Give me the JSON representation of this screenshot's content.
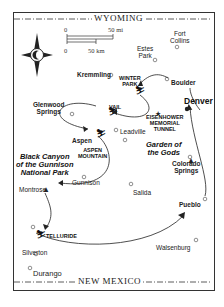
{
  "map": {
    "borders": {
      "north": "WYOMING",
      "south": "NEW MEXICO"
    },
    "scale": {
      "miles_start": "0",
      "miles_end": "50 mi",
      "km_start": "0",
      "km_end": "50 km"
    },
    "compass_icon": "compass-rose-icon",
    "towns": {
      "fort_collins": "Fort\nCollins",
      "estes_park": "Estes\nPark",
      "kremmling": "Kremmling",
      "boulder": "Boulder",
      "denver": "Denver",
      "glenwood_springs": "Glenwood\nSprings",
      "leadville": "Leadville",
      "aspen": "Aspen",
      "gunnison": "Gunnison",
      "montrose": "Montrose",
      "colorado_springs": "Colorado\nSprings",
      "salida": "Salida",
      "pueblo": "Pueblo",
      "silverton": "Silverton",
      "walsenburg": "Walsenburg",
      "durango": "Durango"
    },
    "ski_areas": {
      "winter_park": "WINTER\nPARK",
      "vail": "VAIL",
      "aspen_mountain": "ASPEN\nMOUNTAIN",
      "telluride": "TELLURIDE"
    },
    "landmarks": {
      "eisenhower_tunnel": "EISENHOWER\nMEMORIAL\nTUNNEL",
      "black_canyon": "Black Canyon\nof the Gunnison\nNational Park",
      "garden_of_the_gods": "Garden of\nthe Gods"
    }
  }
}
